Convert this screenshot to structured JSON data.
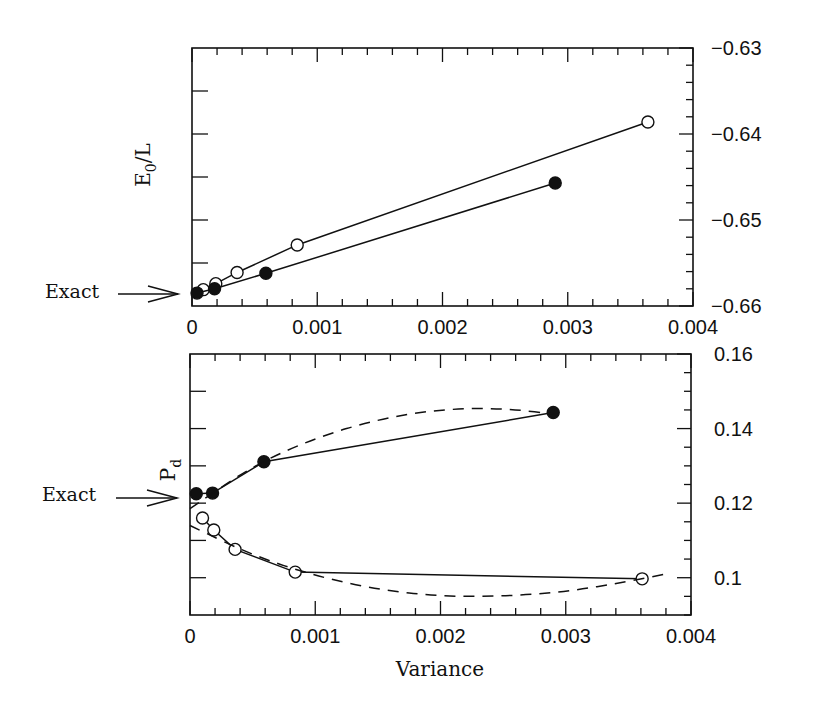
{
  "chart_data": [
    {
      "type": "line",
      "panel": "top",
      "title": "",
      "xlabel": "",
      "ylabel": "E_0/L",
      "xlim": [
        0,
        0.004
      ],
      "ylim": [
        -0.66,
        -0.63
      ],
      "x_ticks": [
        "0",
        "0.001",
        "0.002",
        "0.003",
        "0.004"
      ],
      "y_ticks": [
        "-0.63",
        "-0.64",
        "-0.65",
        "-0.66"
      ],
      "y_axis_label_side": "right",
      "grid": false,
      "annotation": {
        "text": "Exact",
        "arrow_to_y": -0.6585
      },
      "series": [
        {
          "name": "open circles",
          "marker": "open-circle",
          "line": "solid",
          "x": [
            9e-05,
            0.00019,
            0.00036,
            0.00084,
            0.00364
          ],
          "y": [
            -0.6581,
            -0.6574,
            -0.6561,
            -0.6529,
            -0.6386
          ]
        },
        {
          "name": "filled circles",
          "marker": "filled-circle",
          "line": "solid",
          "x": [
            4e-05,
            0.00018,
            0.00059,
            0.0029
          ],
          "y": [
            -0.6585,
            -0.658,
            -0.6562,
            -0.6457
          ]
        }
      ]
    },
    {
      "type": "line",
      "panel": "bottom",
      "title": "",
      "xlabel": "Variance",
      "ylabel": "P_d",
      "xlim": [
        0,
        0.004
      ],
      "ylim": [
        0.09,
        0.16
      ],
      "x_ticks": [
        "0",
        "0.001",
        "0.002",
        "0.003",
        "0.004"
      ],
      "y_ticks": [
        "0.16",
        "0.14",
        "0.12",
        "0.1"
      ],
      "y_axis_label_side": "right",
      "grid": false,
      "annotation": {
        "text": "Exact",
        "arrow_to_y": 0.1225
      },
      "series": [
        {
          "name": "filled circles",
          "marker": "filled-circle",
          "line": "solid",
          "x": [
            5e-05,
            0.00018,
            0.00059,
            0.0029
          ],
          "y": [
            0.1225,
            0.1227,
            0.1311,
            0.1443
          ]
        },
        {
          "name": "open circles",
          "marker": "open-circle",
          "line": "solid",
          "x": [
            0.0001,
            0.00019,
            0.00036,
            0.00084,
            0.00361
          ],
          "y": [
            0.116,
            0.1128,
            0.1076,
            0.1015,
            0.0997
          ]
        },
        {
          "name": "filled fit",
          "marker": "none",
          "line": "dashed",
          "x": [
            0.0,
            0.0005,
            0.001,
            0.0015,
            0.002,
            0.0025,
            0.003
          ],
          "y": [
            0.1185,
            0.13,
            0.1375,
            0.1425,
            0.1452,
            0.1455,
            0.1435
          ]
        },
        {
          "name": "open fit",
          "marker": "none",
          "line": "dashed",
          "x": [
            0.0,
            0.0005,
            0.001,
            0.0015,
            0.002,
            0.0025,
            0.003,
            0.0035,
            0.0038
          ],
          "y": [
            0.114,
            0.106,
            0.1005,
            0.0968,
            0.095,
            0.095,
            0.0962,
            0.099,
            0.101
          ]
        }
      ]
    }
  ],
  "labels": {
    "top_ylabel_main": "E",
    "top_ylabel_sub": "0",
    "top_ylabel_rest": "/L",
    "bottom_ylabel_main": "P",
    "bottom_ylabel_sub": "d",
    "xlabel": "Variance",
    "exact_top": "Exact",
    "exact_bottom": "Exact"
  }
}
